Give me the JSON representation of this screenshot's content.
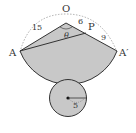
{
  "diagram": {
    "type": "cone-net",
    "points": {
      "apex": "O",
      "left": "A",
      "right": "A′",
      "on_edge": "P"
    },
    "measurements": {
      "OA": "15",
      "OP": "6",
      "PA_prime": "9",
      "base_radius": "5"
    },
    "angle_label": "θ",
    "colors": {
      "fill": "#c8c8c8",
      "stroke": "#333333",
      "dashed": "#888888"
    }
  }
}
